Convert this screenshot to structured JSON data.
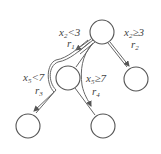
{
  "diagram": {
    "type": "decision-tree",
    "nodes": [
      {
        "id": "root",
        "cx": 102,
        "cy": 32,
        "r": 12
      },
      {
        "id": "left",
        "cx": 68,
        "cy": 78,
        "r": 12
      },
      {
        "id": "right",
        "cx": 136,
        "cy": 79,
        "r": 12
      },
      {
        "id": "left-left",
        "cx": 28,
        "cy": 126,
        "r": 12
      },
      {
        "id": "left-right",
        "cx": 103,
        "cy": 126,
        "r": 12
      }
    ],
    "edges": [
      {
        "from": "root",
        "to": "left",
        "condition_var": "x",
        "condition_sub": "2",
        "condition_op": "<3",
        "region_var": "r",
        "region_sub": "1"
      },
      {
        "from": "root",
        "to": "right",
        "condition_var": "x",
        "condition_sub": "2",
        "condition_op": "≥3",
        "region_var": "r",
        "region_sub": "2"
      },
      {
        "from": "left",
        "to": "left-left",
        "condition_var": "x",
        "condition_sub": "5",
        "condition_op": "<7",
        "region_var": "r",
        "region_sub": "3"
      },
      {
        "from": "left",
        "to": "left-right",
        "condition_var": "x",
        "condition_sub": "5",
        "condition_op": "≥7",
        "region_var": "r",
        "region_sub": "4"
      }
    ],
    "colors": {
      "stroke": "#555555",
      "text": "#444444",
      "background": "#ffffff"
    }
  }
}
